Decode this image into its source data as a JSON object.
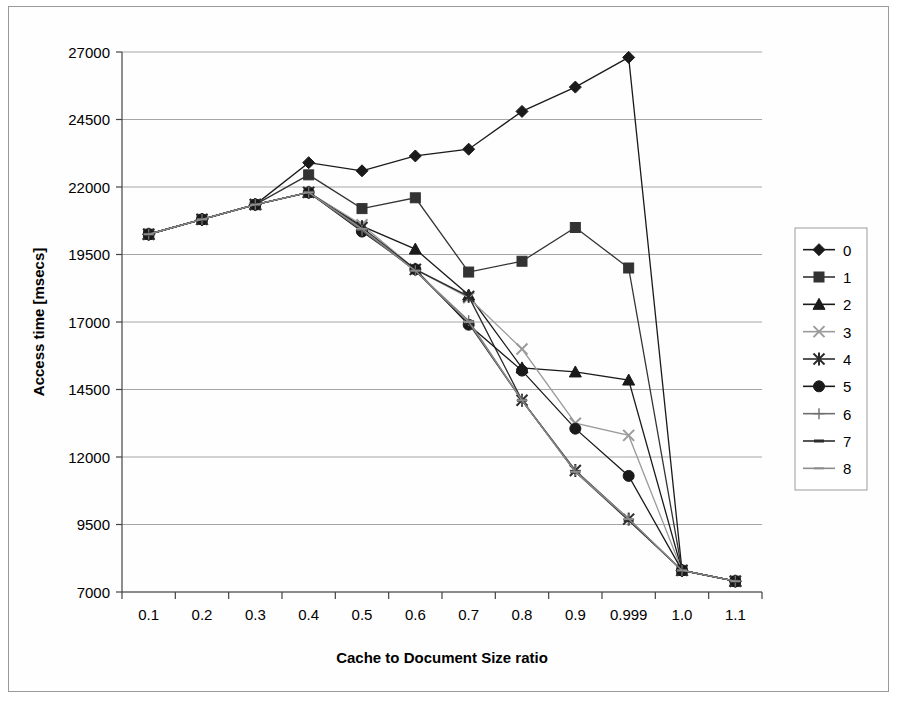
{
  "chart_data": {
    "type": "line",
    "title": "",
    "xlabel": "Cache to Document Size ratio",
    "ylabel": "Access time [msecs]",
    "categories": [
      "0.1",
      "0.2",
      "0.3",
      "0.4",
      "0.5",
      "0.6",
      "0.7",
      "0.8",
      "0.9",
      "0.999",
      "1.0",
      "1.1"
    ],
    "yticks": [
      7000,
      9500,
      12000,
      14500,
      17000,
      19500,
      22000,
      24500,
      27000
    ],
    "ylim": [
      7000,
      27000
    ],
    "grid": true,
    "legend_position": "right",
    "series": [
      {
        "name": "0",
        "marker": "diamond",
        "color": "#1a1a1a",
        "values": [
          20250,
          20800,
          21350,
          22900,
          22600,
          23150,
          23400,
          24800,
          25700,
          26800,
          7800,
          7400
        ]
      },
      {
        "name": "1",
        "marker": "square",
        "color": "#333333",
        "values": [
          20250,
          20800,
          21350,
          22450,
          21200,
          21600,
          18850,
          19250,
          20500,
          19000,
          7800,
          7400
        ]
      },
      {
        "name": "2",
        "marker": "triangle",
        "color": "#1a1a1a",
        "values": [
          20250,
          20800,
          21350,
          21800,
          20550,
          19700,
          18000,
          15300,
          15150,
          14850,
          7800,
          7400
        ]
      },
      {
        "name": "3",
        "marker": "x",
        "color": "#9b9b9b",
        "values": [
          20250,
          20800,
          21350,
          21800,
          20600,
          18950,
          17900,
          16000,
          13250,
          12800,
          7800,
          7400
        ]
      },
      {
        "name": "4",
        "marker": "asterisk",
        "color": "#2b2b2b",
        "values": [
          20250,
          20800,
          21350,
          21800,
          20500,
          18950,
          17950,
          14100,
          11500,
          9700,
          7800,
          7400
        ]
      },
      {
        "name": "5",
        "marker": "circle",
        "color": "#1a1a1a",
        "values": [
          20250,
          20800,
          21350,
          21800,
          20350,
          18950,
          16900,
          15200,
          13050,
          11300,
          7800,
          7400
        ]
      },
      {
        "name": "6",
        "marker": "plus",
        "color": "#6e6e6e",
        "values": [
          20250,
          20800,
          21350,
          21800,
          20400,
          18900,
          17050,
          14100,
          11500,
          9700,
          7800,
          7400
        ]
      },
      {
        "name": "7",
        "marker": "dash",
        "color": "#2b2b2b",
        "values": [
          20250,
          20800,
          21350,
          21800,
          20450,
          18900,
          16950,
          14100,
          11450,
          9650,
          7800,
          7400
        ]
      },
      {
        "name": "8",
        "marker": "line",
        "color": "#8c8c8c",
        "values": [
          20250,
          20800,
          21350,
          21800,
          20450,
          18900,
          17000,
          14100,
          11450,
          9700,
          7800,
          7400
        ]
      }
    ]
  },
  "legend": {
    "entries": [
      "0",
      "1",
      "2",
      "3",
      "4",
      "5",
      "6",
      "7",
      "8"
    ]
  },
  "axes": {
    "x_label": "Cache to Document Size ratio",
    "y_label": "Access time [msecs]",
    "x_ticks": [
      "0.1",
      "0.2",
      "0.3",
      "0.4",
      "0.5",
      "0.6",
      "0.7",
      "0.8",
      "0.9",
      "0.999",
      "1.0",
      "1.1"
    ],
    "y_ticks": [
      "7000",
      "9500",
      "12000",
      "14500",
      "17000",
      "19500",
      "22000",
      "24500",
      "27000"
    ]
  }
}
